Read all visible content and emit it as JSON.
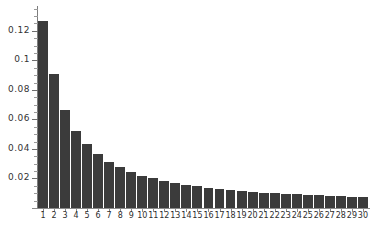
{
  "chart_data": {
    "type": "bar",
    "title": "",
    "subtitle": "",
    "xlabel": "",
    "ylabel": "",
    "categories": [
      "1",
      "2",
      "3",
      "4",
      "5",
      "6",
      "7",
      "8",
      "9",
      "10",
      "11",
      "12",
      "13",
      "14",
      "15",
      "16",
      "17",
      "18",
      "19",
      "20",
      "21",
      "22",
      "23",
      "24",
      "25",
      "26",
      "27",
      "28",
      "29",
      "30"
    ],
    "values": [
      0.1265,
      0.0905,
      0.0665,
      0.0525,
      0.0435,
      0.0365,
      0.0315,
      0.0275,
      0.0245,
      0.022,
      0.02,
      0.0185,
      0.017,
      0.0158,
      0.0147,
      0.0138,
      0.013,
      0.0122,
      0.0116,
      0.011,
      0.0105,
      0.01,
      0.0096,
      0.0092,
      0.0088,
      0.0085,
      0.0082,
      0.0079,
      0.0076,
      0.0073
    ],
    "values_label": "relative frequency",
    "ytick_labels": [
      "0.02",
      "0.04",
      "0.06",
      "0.08",
      "0.1",
      "0.12"
    ],
    "ytick_values": [
      0.02,
      0.04,
      0.06,
      0.08,
      0.1,
      0.12
    ],
    "yminor_step": 0.005,
    "ylim": [
      0,
      0.1355
    ],
    "xlim": [
      0.5,
      30.5
    ],
    "grid": false,
    "legend": null,
    "legend_position": "none",
    "bar_color": "#3b3b3b",
    "axis_color": "#8a8a8a",
    "background_color": "#ffffff",
    "annotations": []
  }
}
